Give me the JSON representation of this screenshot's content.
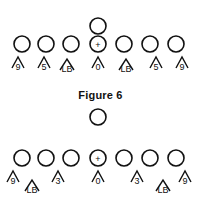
{
  "figures": [
    {
      "caption": "Figure 6",
      "caption_y": 89,
      "top_player": {
        "x": 98,
        "y": 26,
        "r": 8
      },
      "offense": [
        {
          "x": 22,
          "y": 44,
          "r": 8,
          "mark": ""
        },
        {
          "x": 46,
          "y": 44,
          "r": 8,
          "mark": ""
        },
        {
          "x": 71,
          "y": 44,
          "r": 8,
          "mark": ""
        },
        {
          "x": 98,
          "y": 44,
          "r": 8,
          "mark": "+"
        },
        {
          "x": 124,
          "y": 44,
          "r": 8,
          "mark": ""
        },
        {
          "x": 150,
          "y": 44,
          "r": 8,
          "mark": ""
        },
        {
          "x": 176,
          "y": 44,
          "r": 8,
          "mark": ""
        }
      ],
      "defense": [
        {
          "x": 18,
          "y": 66,
          "label": "9"
        },
        {
          "x": 44,
          "y": 66,
          "label": "5"
        },
        {
          "x": 67,
          "y": 68,
          "label": "LB"
        },
        {
          "x": 98,
          "y": 66,
          "label": "0"
        },
        {
          "x": 126,
          "y": 68,
          "label": "LB"
        },
        {
          "x": 156,
          "y": 66,
          "label": "5"
        },
        {
          "x": 182,
          "y": 66,
          "label": "9"
        }
      ]
    },
    {
      "caption": "",
      "top_player": {
        "x": 98,
        "y": 117,
        "r": 8
      },
      "offense": [
        {
          "x": 22,
          "y": 158,
          "r": 8,
          "mark": ""
        },
        {
          "x": 46,
          "y": 158,
          "r": 8,
          "mark": ""
        },
        {
          "x": 71,
          "y": 158,
          "r": 8,
          "mark": ""
        },
        {
          "x": 98,
          "y": 158,
          "r": 8,
          "mark": "+"
        },
        {
          "x": 124,
          "y": 158,
          "r": 8,
          "mark": ""
        },
        {
          "x": 150,
          "y": 158,
          "r": 8,
          "mark": ""
        },
        {
          "x": 176,
          "y": 158,
          "r": 8,
          "mark": ""
        }
      ],
      "defense": [
        {
          "x": 13,
          "y": 180,
          "label": "9"
        },
        {
          "x": 32,
          "y": 189,
          "label": "LB"
        },
        {
          "x": 58,
          "y": 180,
          "label": "3"
        },
        {
          "x": 98,
          "y": 180,
          "label": "0"
        },
        {
          "x": 137,
          "y": 180,
          "label": "3"
        },
        {
          "x": 163,
          "y": 189,
          "label": "LB"
        },
        {
          "x": 185,
          "y": 180,
          "label": "9"
        }
      ]
    }
  ]
}
